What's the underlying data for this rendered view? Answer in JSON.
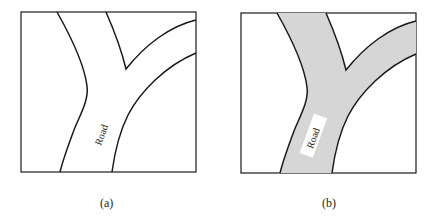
{
  "panels": [
    {
      "id": "a",
      "caption": "(a)",
      "road_label": "Road",
      "fill": "none"
    },
    {
      "id": "b",
      "caption": "(b)",
      "road_label": "Road",
      "fill": "#d6d6d6"
    }
  ],
  "colors": {
    "line": "#1a1a1a",
    "road_fill": "#d6d6d6",
    "background": "#ffffff"
  }
}
